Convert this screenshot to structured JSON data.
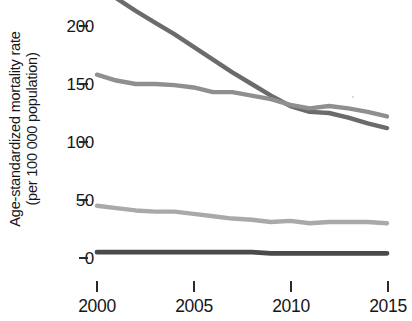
{
  "axes": {
    "y_axis_title_line1": "Age-standardized mortality rate",
    "y_axis_title_line2": "(per 100 000 population)",
    "y_axis_title": "Age-standardized mortality rate\n(per 100 000 population)",
    "y_ticks": [
      "200",
      "150",
      "100",
      "50",
      "0"
    ],
    "x_ticks": [
      "2000",
      "2005",
      "2010",
      "2015"
    ]
  },
  "colors": {
    "series_1": "#6b6b6b",
    "series_2": "#8f8f8f",
    "series_3": "#a9a9a9",
    "series_4": "#4a4a4a",
    "axis": "#2a2a2a",
    "text": "#161616",
    "background": "#ffffff"
  },
  "chart_data": {
    "type": "line",
    "title": "",
    "xlabel": "",
    "ylabel": "Age-standardized mortality rate (per 100 000 population)",
    "xlim": [
      2000,
      2015
    ],
    "ylim": [
      0,
      225
    ],
    "grid": false,
    "legend": "none",
    "x": [
      2000,
      2001,
      2002,
      2003,
      2004,
      2005,
      2006,
      2007,
      2008,
      2009,
      2010,
      2011,
      2012,
      2013,
      2014,
      2015
    ],
    "series": [
      {
        "name": "series-1",
        "color": "#6b6b6b",
        "values": [
          232,
          224,
          213,
          203,
          193,
          182,
          171,
          160,
          150,
          140,
          131,
          126,
          125,
          121,
          116,
          112
        ]
      },
      {
        "name": "series-2",
        "color": "#8f8f8f",
        "values": [
          158,
          153,
          150,
          150,
          149,
          147,
          143,
          143,
          140,
          137,
          132,
          129,
          131,
          129,
          126,
          122
        ]
      },
      {
        "name": "series-3",
        "color": "#a9a9a9",
        "values": [
          45,
          43,
          41,
          40,
          40,
          38,
          36,
          34,
          33,
          31,
          32,
          30,
          31,
          31,
          31,
          30
        ]
      },
      {
        "name": "series-4",
        "color": "#4a4a4a",
        "values": [
          5,
          5,
          5,
          5,
          5,
          5,
          5,
          5,
          5,
          4,
          4,
          4,
          4,
          4,
          4,
          4
        ]
      }
    ]
  }
}
